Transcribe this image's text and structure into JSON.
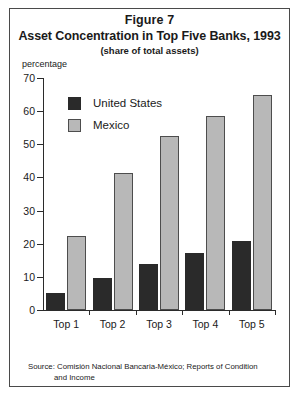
{
  "figure": {
    "number_label": "Figure 7",
    "title": "Asset Concentration in Top Five Banks, 1993",
    "subtitle": "(share of total assets)",
    "axis_unit": "percentage",
    "source_label": "Source:",
    "source_text": "Comisión Nacional Bancaria-México; Reports of Condition",
    "source_text_line2": "and Income"
  },
  "colors": {
    "united_states": "#2a2a2a",
    "mexico": "#b8b8b8",
    "axis": "#2b2b2b",
    "frame": "#4a4a4a",
    "text": "#1a1a1a"
  },
  "chart_data": {
    "type": "bar",
    "title": "Asset Concentration in Top Five Banks, 1993",
    "subtitle": "(share of total assets)",
    "xlabel": "",
    "ylabel": "percentage",
    "ylim": [
      0,
      70
    ],
    "ytick_values": [
      0,
      10,
      20,
      30,
      40,
      50,
      60,
      70
    ],
    "ytick_labels": [
      "0",
      "10",
      "20",
      "30",
      "40",
      "50",
      "60",
      "70"
    ],
    "grid": false,
    "legend_position": "upper-left-inside",
    "categories": [
      "Top 1",
      "Top 2",
      "Top 3",
      "Top 4",
      "Top 5"
    ],
    "series": [
      {
        "name": "United States",
        "color": "#2a2a2a",
        "values": [
          5,
          9.8,
          14,
          17.3,
          20.8
        ]
      },
      {
        "name": "Mexico",
        "color": "#b8b8b8",
        "values": [
          22.4,
          41.3,
          52.5,
          58.4,
          64.8
        ]
      }
    ]
  }
}
